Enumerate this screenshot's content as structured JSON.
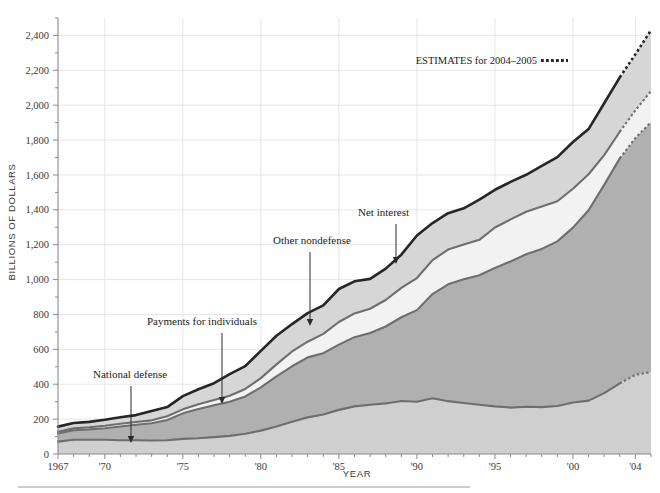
{
  "figure": {
    "top_caption": "",
    "axis_y_title": "BILLIONS OF DOLLARS",
    "axis_x_title": "YEAR",
    "legend_text": "ESTIMATES for 2004–2005"
  },
  "annotations": {
    "national_defense": "National defense",
    "payments_for_individuals": "Payments for individuals",
    "other_nondefense": "Other nondefense",
    "net_interest": "Net interest"
  },
  "colors": {
    "national_defense_fill": "#cfcfcf",
    "payments_fill": "#b0b0b0",
    "net_interest_fill": "#f2f2f2",
    "other_nondefense_fill": "#d6d6d6",
    "total_line": "#262626",
    "band_line": "#6e6e6e",
    "grid": "#e3e3e6",
    "axis": "#8a8a8a",
    "text": "#231f20"
  },
  "chart_data": {
    "type": "area",
    "title": "",
    "xlabel": "YEAR",
    "ylabel": "BILLIONS OF DOLLARS",
    "xlim": [
      1967,
      2005
    ],
    "ylim": [
      0,
      2500
    ],
    "ytick_values": [
      0,
      200,
      400,
      600,
      800,
      1000,
      1200,
      1400,
      1600,
      1800,
      2000,
      2200,
      2400
    ],
    "ytick_labels": [
      "0",
      "200",
      "400",
      "600",
      "800",
      "1,000",
      "1,200",
      "1,400",
      "1,600",
      "1,800",
      "2,000",
      "2,200",
      "2,400"
    ],
    "yminor_step": 100,
    "xtick_values": [
      1967,
      1970,
      1975,
      1980,
      1985,
      1990,
      1995,
      2000,
      2004
    ],
    "xtick_labels": [
      "1967",
      "'70",
      "'75",
      "'80",
      "'85",
      "'90",
      "'95",
      "'00",
      "'04"
    ],
    "xminor_step": 1,
    "grid": "both-major",
    "legend": {
      "position": "top-right",
      "entries": [
        {
          "label": "ESTIMATES for 2004–2005",
          "style": "dotted"
        }
      ]
    },
    "stacking": "stacked-cumulative",
    "estimate_from_year": 2003,
    "x": [
      1967,
      1968,
      1969,
      1970,
      1971,
      1972,
      1973,
      1974,
      1975,
      1976,
      1977,
      1978,
      1979,
      1980,
      1981,
      1982,
      1983,
      1984,
      1985,
      1986,
      1987,
      1988,
      1989,
      1990,
      1991,
      1992,
      1993,
      1994,
      1995,
      1996,
      1997,
      1998,
      1999,
      2000,
      2001,
      2002,
      2003,
      2004,
      2005
    ],
    "series": [
      {
        "name": "National defense",
        "order": 1,
        "fill": "#cfcfcf",
        "values": [
          71,
          82,
          82,
          82,
          79,
          79,
          77,
          79,
          87,
          90,
          97,
          104,
          116,
          134,
          158,
          185,
          210,
          227,
          253,
          273,
          282,
          290,
          304,
          300,
          320,
          303,
          292,
          282,
          273,
          266,
          271,
          269,
          275,
          295,
          306,
          349,
          405,
          454,
          470
        ]
      },
      {
        "name": "Payments for individuals",
        "order": 2,
        "fill": "#b0b0b0",
        "values": [
          47,
          54,
          59,
          66,
          79,
          89,
          99,
          116,
          146,
          168,
          182,
          195,
          214,
          248,
          287,
          318,
          344,
          351,
          374,
          397,
          412,
          441,
          480,
          525,
          597,
          670,
          710,
          743,
          794,
          838,
          874,
          907,
          944,
          1003,
          1092,
          1194,
          1290,
          1358,
          1433
        ]
      },
      {
        "name": "Net interest",
        "order": 3,
        "fill": "#f2f2f2",
        "values": [
          10,
          11,
          12,
          14,
          15,
          15,
          17,
          21,
          23,
          27,
          30,
          35,
          43,
          53,
          69,
          85,
          90,
          111,
          130,
          136,
          139,
          152,
          169,
          184,
          195,
          199,
          199,
          203,
          232,
          241,
          244,
          243,
          230,
          223,
          206,
          171,
          153,
          159,
          178
        ]
      },
      {
        "name": "Other nondefense",
        "order": 4,
        "fill": "#d6d6d6",
        "values": [
          29,
          31,
          31,
          34,
          38,
          40,
          53,
          53,
          76,
          86,
          97,
          124,
          131,
          156,
          164,
          157,
          164,
          163,
          189,
          184,
          171,
          180,
          190,
          244,
          212,
          209,
          208,
          230,
          216,
          215,
          212,
          233,
          253,
          268,
          259,
          297,
          312,
          321,
          349
        ]
      }
    ],
    "cumulative_total": [
      157,
      178,
      184,
      196,
      211,
      223,
      246,
      269,
      332,
      371,
      406,
      458,
      504,
      591,
      678,
      745,
      808,
      852,
      946,
      990,
      1004,
      1063,
      1143,
      1253,
      1324,
      1381,
      1409,
      1458,
      1515,
      1560,
      1601,
      1652,
      1702,
      1789,
      1863,
      2011,
      2160,
      2292,
      2430
    ]
  }
}
